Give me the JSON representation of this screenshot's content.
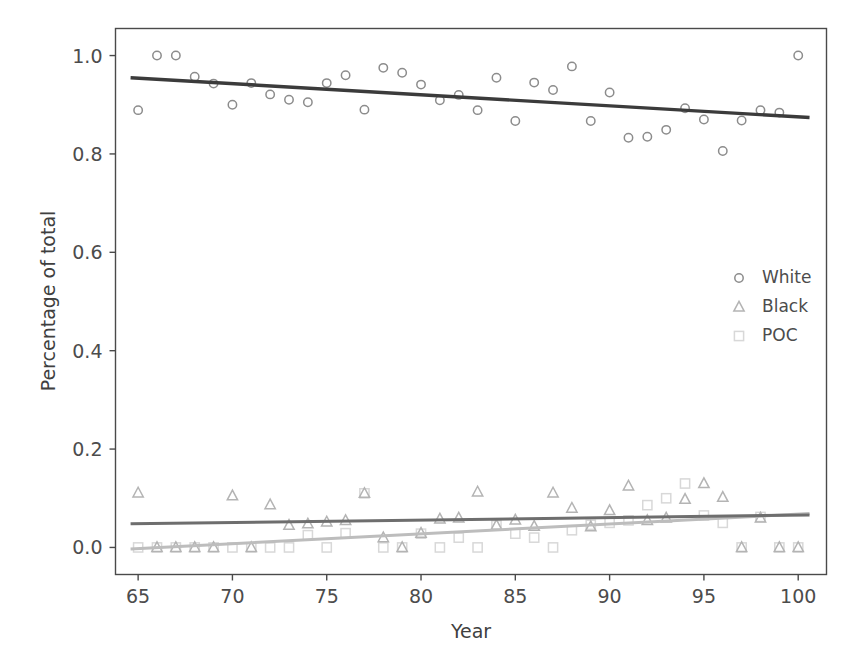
{
  "chart_data": {
    "type": "scatter",
    "title": "",
    "xlabel": "Year",
    "ylabel": "Percentage of total",
    "xlim": [
      63.8,
      101.5
    ],
    "ylim": [
      -0.055,
      1.055
    ],
    "xticks": [
      65,
      70,
      75,
      80,
      85,
      90,
      95,
      100
    ],
    "xticklabels": [
      "65",
      "70",
      "75",
      "80",
      "85",
      "90",
      "95",
      "100"
    ],
    "yticks": [
      0.0,
      0.2,
      0.4,
      0.6,
      0.8,
      1.0
    ],
    "yticklabels": [
      "0.0",
      "0.2",
      "0.4",
      "0.6",
      "0.8",
      "1.0"
    ],
    "grid": false,
    "legend_position": "center right",
    "series": [
      {
        "name": "White",
        "marker": "circle",
        "color": "#8c8c8c",
        "line_color": "#3b3b3b",
        "x": [
          65,
          66,
          67,
          68,
          69,
          70,
          71,
          72,
          73,
          74,
          75,
          76,
          77,
          78,
          79,
          80,
          81,
          82,
          83,
          84,
          85,
          86,
          87,
          88,
          89,
          90,
          91,
          92,
          93,
          94,
          95,
          96,
          97,
          98,
          99,
          100
        ],
        "y": [
          0.889,
          1.0,
          1.0,
          0.957,
          0.943,
          0.9,
          0.944,
          0.921,
          0.91,
          0.905,
          0.944,
          0.96,
          0.89,
          0.975,
          0.965,
          0.941,
          0.909,
          0.92,
          0.889,
          0.955,
          0.867,
          0.945,
          0.93,
          0.978,
          0.867,
          0.925,
          0.833,
          0.835,
          0.849,
          0.893,
          0.87,
          0.806,
          0.868,
          0.889,
          0.884,
          1.0
        ],
        "fit_line": {
          "x": [
            64.6,
            100.6
          ],
          "y": [
            0.955,
            0.874
          ]
        }
      },
      {
        "name": "Black",
        "marker": "triangle",
        "color": "#b4b4b4",
        "line_color": "#6e6e6e",
        "x": [
          65,
          66,
          67,
          68,
          69,
          70,
          71,
          72,
          73,
          74,
          75,
          76,
          77,
          78,
          79,
          80,
          81,
          82,
          83,
          84,
          85,
          86,
          87,
          88,
          89,
          90,
          91,
          92,
          93,
          94,
          95,
          96,
          97,
          98,
          99,
          100
        ],
        "y": [
          0.111,
          0.0,
          0.0,
          0.0,
          0.0,
          0.105,
          0.0,
          0.087,
          0.045,
          0.048,
          0.052,
          0.055,
          0.11,
          0.02,
          0.0,
          0.029,
          0.058,
          0.06,
          0.113,
          0.045,
          0.056,
          0.043,
          0.111,
          0.08,
          0.042,
          0.075,
          0.125,
          0.055,
          0.06,
          0.098,
          0.13,
          0.102,
          0.0,
          0.06,
          0.0,
          0.0
        ],
        "fit_line": {
          "x": [
            64.6,
            100.6
          ],
          "y": [
            0.048,
            0.066
          ]
        }
      },
      {
        "name": "POC",
        "marker": "square",
        "color": "#d8d8d8",
        "line_color": "#bdbdbd",
        "x": [
          65,
          66,
          67,
          68,
          69,
          70,
          71,
          72,
          73,
          74,
          75,
          76,
          77,
          78,
          79,
          80,
          81,
          82,
          83,
          84,
          85,
          86,
          87,
          88,
          89,
          90,
          91,
          92,
          93,
          94,
          95,
          96,
          97,
          98,
          99,
          100
        ],
        "y": [
          0.0,
          0.0,
          0.0,
          0.0,
          0.0,
          0.0,
          0.0,
          0.0,
          0.0,
          0.025,
          0.0,
          0.029,
          0.11,
          0.0,
          0.0,
          0.028,
          0.0,
          0.02,
          0.0,
          0.045,
          0.028,
          0.02,
          0.0,
          0.035,
          0.046,
          0.05,
          0.055,
          0.086,
          0.1,
          0.13,
          0.065,
          0.05,
          0.0,
          0.062,
          0.0,
          0.0
        ],
        "fit_line": {
          "x": [
            64.6,
            100.6
          ],
          "y": [
            -0.003,
            0.069
          ]
        }
      }
    ]
  },
  "legend": {
    "entries": [
      {
        "label": "White",
        "marker": "circle-icon"
      },
      {
        "label": "Black",
        "marker": "triangle-icon"
      },
      {
        "label": "POC",
        "marker": "square-icon"
      }
    ]
  },
  "colors": {
    "white_marker": "#8c8c8c",
    "black_marker": "#b4b4b4",
    "poc_marker": "#d8d8d8",
    "white_fit": "#3b3b3b",
    "black_fit": "#6e6e6e",
    "poc_fit": "#bdbdbd",
    "axis": "#4a4a4a",
    "text": "#4c4c4c",
    "background": "#ffffff"
  }
}
